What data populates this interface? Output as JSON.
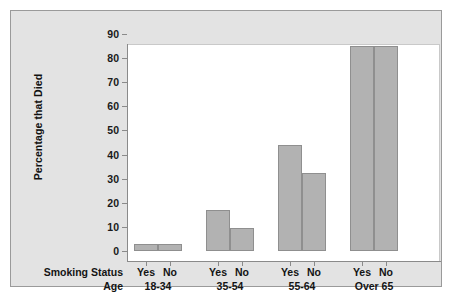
{
  "chart_data": {
    "type": "bar",
    "title": "",
    "subtitle": "",
    "xlabel": "",
    "ylabel": "Percentage that Died",
    "ylim": [
      0,
      90
    ],
    "ytick_labels": [
      "0",
      "10",
      "20",
      "30",
      "40",
      "50",
      "60",
      "70",
      "80",
      "90"
    ],
    "ytick_values": [
      0,
      10,
      20,
      30,
      40,
      50,
      60,
      70,
      80,
      90
    ],
    "grid": false,
    "legend": "none",
    "row_labels": {
      "smoking_status": "Smoking Status",
      "age": "Age"
    },
    "categories": [
      "18-34",
      "35-54",
      "55-64",
      "Over 65"
    ],
    "subcategories": [
      "Yes",
      "No"
    ],
    "series": [
      {
        "name": "Yes",
        "values": [
          3,
          17,
          44,
          85
        ]
      },
      {
        "name": "No",
        "values": [
          3,
          9.5,
          32.5,
          85
        ]
      }
    ],
    "bars": [
      {
        "group": "18-34",
        "smoking": "Yes",
        "value": 3
      },
      {
        "group": "18-34",
        "smoking": "No",
        "value": 3
      },
      {
        "group": "35-54",
        "smoking": "Yes",
        "value": 17
      },
      {
        "group": "35-54",
        "smoking": "No",
        "value": 9.5
      },
      {
        "group": "55-64",
        "smoking": "Yes",
        "value": 44
      },
      {
        "group": "55-64",
        "smoking": "No",
        "value": 32.5
      },
      {
        "group": "Over 65",
        "smoking": "Yes",
        "value": 85
      },
      {
        "group": "Over 65",
        "smoking": "No",
        "value": 85
      }
    ],
    "colors": {
      "bar_fill": "#b2b2b2",
      "bar_edge": "#8f8f8f",
      "panel_background": "#e3e3e3",
      "plot_background": "#ffffff",
      "axis": "#8a8a8a",
      "text": "#141414"
    }
  }
}
